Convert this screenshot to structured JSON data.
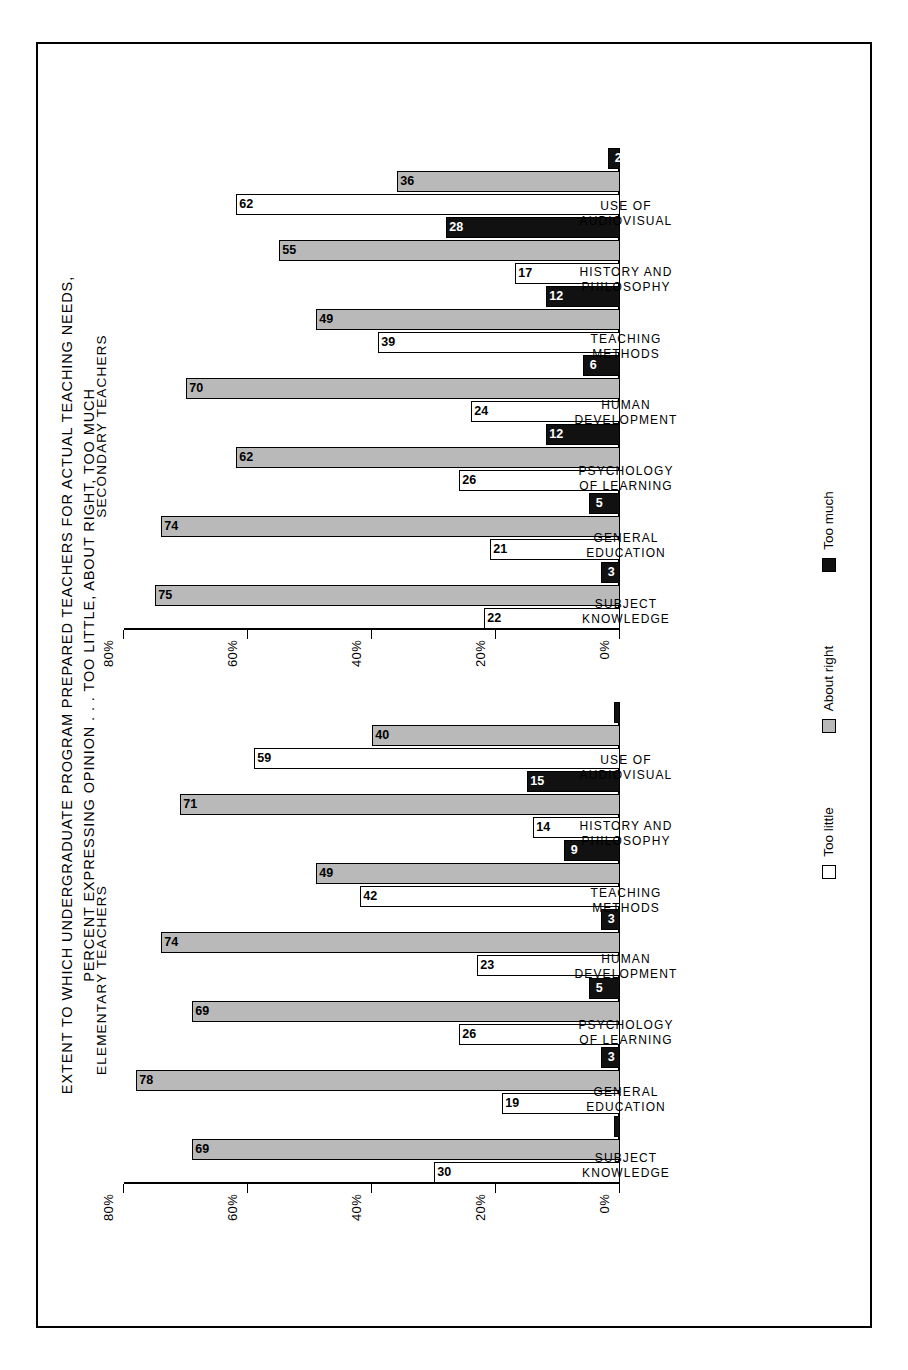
{
  "title": {
    "line1": "EXTENT TO WHICH UNDERGRADUATE PROGRAM PREPARED TEACHERS FOR ACTUAL TEACHING NEEDS,",
    "line2": "PERCENT EXPRESSING OPINION . . . TOO LITTLE, ABOUT RIGHT, TOO MUCH"
  },
  "panels": {
    "elementary": "ELEMENTARY TEACHERS",
    "secondary": "SECONDARY TEACHERS"
  },
  "legend": [
    {
      "key": "little",
      "label": "Too little",
      "color": "#ffffff"
    },
    {
      "key": "right",
      "label": "About right",
      "color": "#b9b9b9"
    },
    {
      "key": "much",
      "label": "Too much",
      "color": "#111111"
    }
  ],
  "axis": {
    "ticks": [
      "0%",
      "20%",
      "40%",
      "60%",
      "80%"
    ],
    "tick_values": [
      0,
      20,
      40,
      60,
      80
    ],
    "max": 80
  },
  "categories": [
    {
      "line1": "SUBJECT",
      "line2": "KNOWLEDGE"
    },
    {
      "line1": "GENERAL",
      "line2": "EDUCATION"
    },
    {
      "line1": "PSYCHOLOGY",
      "line2": "OF LEARNING"
    },
    {
      "line1": "HUMAN",
      "line2": "DEVELOPMENT"
    },
    {
      "line1": "TEACHING",
      "line2": "METHODS"
    },
    {
      "line1": "HISTORY AND",
      "line2": "PHILOSOPHY"
    },
    {
      "line1": "USE OF",
      "line2": "AUDIOVISUAL"
    }
  ],
  "chart_data": {
    "type": "bar",
    "title": "EXTENT TO WHICH UNDERGRADUATE PROGRAM PREPARED TEACHERS FOR ACTUAL TEACHING NEEDS, PERCENT EXPRESSING OPINION . . . TOO LITTLE, ABOUT RIGHT, TOO MUCH",
    "xlabel": "",
    "ylabel": "",
    "ylim": [
      0,
      80
    ],
    "grid": false,
    "legend_position": "bottom",
    "orientation": "vertical-bars-rotated-page",
    "categories": [
      "SUBJECT KNOWLEDGE",
      "GENERAL EDUCATION",
      "PSYCHOLOGY OF LEARNING",
      "HUMAN DEVELOPMENT",
      "TEACHING METHODS",
      "HISTORY AND PHILOSOPHY",
      "USE OF AUDIOVISUAL"
    ],
    "panels": [
      {
        "name": "ELEMENTARY TEACHERS",
        "series": [
          {
            "name": "Too little",
            "values": [
              30,
              19,
              26,
              23,
              42,
              14,
              59
            ]
          },
          {
            "name": "About right",
            "values": [
              69,
              78,
              69,
              74,
              49,
              71,
              40
            ]
          },
          {
            "name": "Too much",
            "values": [
              1,
              3,
              5,
              3,
              9,
              15,
              1
            ]
          }
        ]
      },
      {
        "name": "SECONDARY TEACHERS",
        "series": [
          {
            "name": "Too little",
            "values": [
              22,
              21,
              26,
              24,
              39,
              17,
              62
            ]
          },
          {
            "name": "About right",
            "values": [
              75,
              74,
              62,
              70,
              49,
              55,
              36
            ]
          },
          {
            "name": "Too much",
            "values": [
              3,
              5,
              12,
              6,
              12,
              28,
              2
            ]
          }
        ]
      }
    ]
  }
}
